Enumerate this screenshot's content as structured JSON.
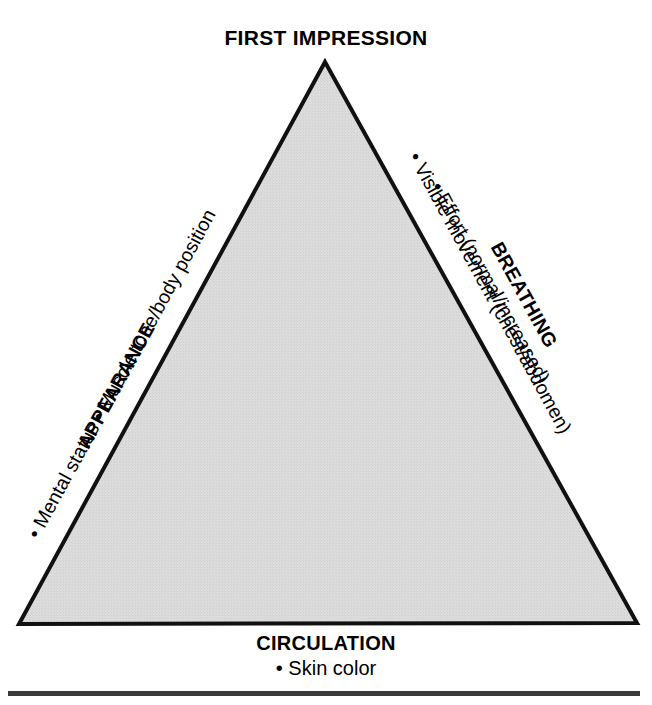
{
  "figure": {
    "name": "Pediatric Assessment Triangle",
    "apex_label": "FIRST IMPRESSION",
    "fill_color": "#d9d9d9",
    "stroke_color": "#111111",
    "rule_color": "#3a3a3a",
    "background_color": "#ffffff"
  },
  "left_side": {
    "heading": "APPEARANCE",
    "bullets_line": "• Mental status • Muscle tone/body position",
    "bullets": [
      "Mental status",
      "Muscle tone/body position"
    ]
  },
  "right_side": {
    "heading": "BREATHING",
    "bullets": [
      "• Visible movement (chest/abdomen)",
      "• Effort (normal/increased)"
    ],
    "bullet_1": "• Visible movement (chest/abdomen)",
    "bullet_2": "• Effort (normal/increased)"
  },
  "bottom_side": {
    "heading": "CIRCULATION",
    "bullets": [
      "• Skin color"
    ],
    "bullet_1": "• Skin color"
  }
}
